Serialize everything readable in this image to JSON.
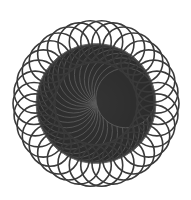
{
  "image": {
    "description": "Spirograph rosette pattern",
    "background": "#ffffff",
    "stroke_color": "#3a3a3a",
    "center_fill": "#9a9a9a"
  },
  "pattern": {
    "center": [
      96,
      103.5
    ],
    "loop_count": 34,
    "ring_radius": 62,
    "loop_radius": 21,
    "inner_disk_radius": 58,
    "stroke_width": 1.6
  }
}
